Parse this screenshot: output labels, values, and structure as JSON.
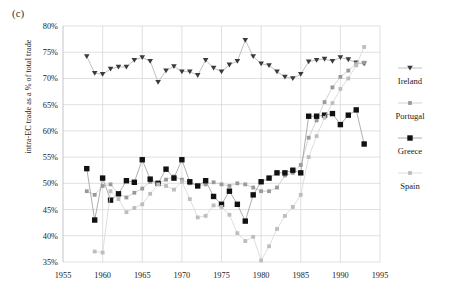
{
  "panel": {
    "label": "(c)"
  },
  "chart_data": {
    "type": "line",
    "title": "",
    "subtitle": "",
    "xlabel": "",
    "ylabel": "intra-EC trade as a % of total trade",
    "xlim": [
      1955,
      1995
    ],
    "ylim": [
      35,
      80
    ],
    "xticks": [
      1955,
      1960,
      1965,
      1970,
      1975,
      1980,
      1985,
      1990,
      1995
    ],
    "yticks": [
      35,
      40,
      45,
      50,
      55,
      60,
      65,
      70,
      75,
      80
    ],
    "ytick_labels": [
      "35%",
      "40%",
      "45%",
      "50%",
      "55%",
      "60%",
      "65%",
      "70%",
      "75%",
      "80%"
    ],
    "xtick_labels": [
      "1955",
      "1960",
      "1965",
      "1970",
      "1975",
      "1980",
      "1985",
      "1990",
      "1995"
    ],
    "grid": true,
    "legend_position": "right",
    "marker_colors": {
      "Ireland": "#3a3a3a",
      "Portugal": "#9a9a9a",
      "Greece": "#111111",
      "Spain": "#bdbdbd"
    },
    "line_colors": {
      "Ireland": "#b0b0b0",
      "Portugal": "#c8c8c8",
      "Greece": "#9a9a9a",
      "Spain": "#d5d5d5"
    },
    "markers": {
      "Ireland": "triangle-down",
      "Portugal": "square",
      "Greece": "square-filled",
      "Spain": "square"
    },
    "series": [
      {
        "name": "Ireland",
        "x": [
          1958,
          1959,
          1960,
          1961,
          1962,
          1963,
          1964,
          1965,
          1966,
          1967,
          1968,
          1969,
          1970,
          1971,
          1972,
          1973,
          1974,
          1975,
          1976,
          1977,
          1978,
          1979,
          1980,
          1981,
          1982,
          1983,
          1984,
          1985,
          1986,
          1987,
          1988,
          1989,
          1990,
          1991,
          1992,
          1993
        ],
        "y": [
          74.2,
          71.0,
          70.8,
          71.8,
          72.2,
          72.2,
          73.5,
          74.0,
          73.3,
          69.3,
          71.5,
          72.3,
          71.3,
          71.3,
          70.6,
          73.5,
          72.0,
          71.3,
          72.6,
          73.3,
          77.3,
          74.2,
          72.8,
          72.5,
          71.3,
          70.3,
          70.0,
          70.8,
          73.2,
          73.5,
          73.7,
          73.3,
          74.0,
          73.6,
          73.0,
          72.8
        ]
      },
      {
        "name": "Portugal",
        "x": [
          1958,
          1959,
          1960,
          1961,
          1962,
          1963,
          1964,
          1965,
          1966,
          1967,
          1968,
          1969,
          1970,
          1971,
          1972,
          1973,
          1974,
          1975,
          1976,
          1977,
          1978,
          1979,
          1980,
          1981,
          1982,
          1983,
          1984,
          1985,
          1986,
          1987,
          1988,
          1989,
          1990,
          1991,
          1992,
          1993
        ],
        "y": [
          48.5,
          47.8,
          49.5,
          49.8,
          48.0,
          47.3,
          48.2,
          49.0,
          50.3,
          50.0,
          50.7,
          51.3,
          50.7,
          50.0,
          49.5,
          49.8,
          50.2,
          49.8,
          49.5,
          50.0,
          49.8,
          49.2,
          48.5,
          48.5,
          49.2,
          51.5,
          52.0,
          53.5,
          58.7,
          62.0,
          65.5,
          68.3,
          70.3,
          71.5,
          72.8,
          73.0
        ]
      },
      {
        "name": "Greece",
        "x": [
          1958,
          1959,
          1960,
          1961,
          1962,
          1963,
          1964,
          1965,
          1966,
          1967,
          1968,
          1969,
          1970,
          1971,
          1972,
          1973,
          1974,
          1975,
          1976,
          1977,
          1978,
          1979,
          1980,
          1981,
          1982,
          1983,
          1984,
          1985,
          1986,
          1987,
          1988,
          1989,
          1990,
          1991,
          1992,
          1993
        ],
        "y": [
          52.8,
          43.0,
          51.0,
          46.8,
          48.0,
          50.5,
          50.2,
          54.5,
          50.8,
          50.0,
          52.7,
          51.0,
          54.5,
          50.3,
          49.5,
          50.5,
          47.5,
          46.0,
          48.5,
          46.0,
          42.8,
          47.8,
          50.3,
          51.0,
          52.0,
          52.0,
          52.5,
          52.0,
          62.8,
          62.8,
          63.0,
          63.3,
          61.2,
          63.0,
          64.0,
          57.5
        ]
      },
      {
        "name": "Spain",
        "x": [
          1959,
          1960,
          1961,
          1962,
          1963,
          1964,
          1965,
          1966,
          1967,
          1968,
          1969,
          1970,
          1971,
          1972,
          1973,
          1974,
          1975,
          1976,
          1977,
          1978,
          1979,
          1980,
          1981,
          1982,
          1983,
          1984,
          1985,
          1986,
          1987,
          1988,
          1989,
          1990,
          1991,
          1992,
          1993
        ],
        "y": [
          37.0,
          36.8,
          48.5,
          47.0,
          44.5,
          45.3,
          46.0,
          48.0,
          49.8,
          49.5,
          48.8,
          50.3,
          47.0,
          43.5,
          43.8,
          45.8,
          45.5,
          44.0,
          40.5,
          39.0,
          39.8,
          35.3,
          38.0,
          41.3,
          43.8,
          45.5,
          47.8,
          55.0,
          59.0,
          62.5,
          65.3,
          68.0,
          70.0,
          72.5,
          76.0
        ]
      }
    ]
  },
  "legend": {
    "items": [
      {
        "label": "Ireland",
        "marker": "triangle-down"
      },
      {
        "label": "Portugal",
        "marker": "square"
      },
      {
        "label": "Greece",
        "marker": "square-filled"
      },
      {
        "label": "Spain",
        "marker": "square"
      }
    ]
  }
}
